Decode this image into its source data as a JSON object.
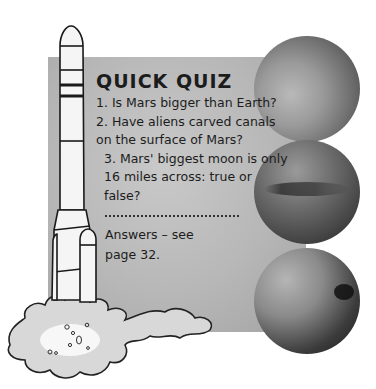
{
  "quiz": {
    "title": "QUICK QUIZ",
    "questions": [
      "1. Is Mars bigger than Earth?",
      "2. Have aliens carved canals on the surface of Mars?",
      "3. Mars' biggest moon is only 16 miles across: true or false?"
    ],
    "answers_line1": "Answers – see",
    "answers_line2": "page 32."
  },
  "illustrations": {
    "rocket": "rocket-illustration",
    "smoke": "launch-smoke",
    "planets": [
      "mars-photo-1",
      "mars-photo-2",
      "mars-photo-3"
    ]
  },
  "colors": {
    "panel": "#b9b9b9",
    "text": "#1c1c1c",
    "background": "#ffffff"
  }
}
